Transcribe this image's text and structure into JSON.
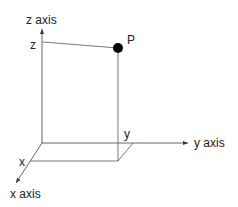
{
  "diagram": {
    "axes": {
      "x": {
        "label": "x axis"
      },
      "y": {
        "label": "y axis"
      },
      "z": {
        "label": "z axis"
      }
    },
    "point": {
      "label": "P",
      "color": "#000000"
    },
    "projections": {
      "x_label": "x",
      "y_label": "y",
      "z_label": "z"
    },
    "colors": {
      "line": "#555555",
      "text": "#222222"
    }
  }
}
